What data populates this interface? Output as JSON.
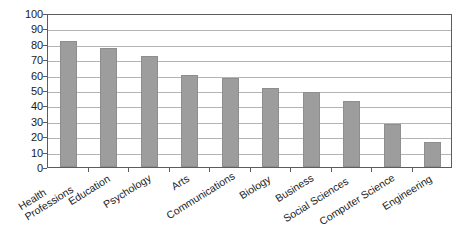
{
  "chart_data": {
    "type": "bar",
    "title": "",
    "subtitle": "",
    "xlabel": "",
    "ylabel": "",
    "ylim": [
      0,
      100
    ],
    "yticks": [
      0,
      10,
      20,
      30,
      40,
      50,
      60,
      70,
      80,
      90,
      100
    ],
    "ytick_labels": [
      "0",
      "10",
      "20",
      "30",
      "40",
      "50",
      "60",
      "70",
      "80",
      "90",
      "100"
    ],
    "grid": "horizontal",
    "legend": "none",
    "bar_color": "#9d9d9d",
    "bar_edge_color": "#8e8e8e",
    "gridline_color": "#b4b4b4",
    "axis_color": "#5c5c5c",
    "background": "#ffffff",
    "categories": [
      "Health Professions",
      "Education",
      "Psychology",
      "Arts",
      "Communications",
      "Biology",
      "Business",
      "Social Sciences",
      "Computer Science",
      "Engineering"
    ],
    "category_lines": [
      [
        "Health",
        "Professions"
      ],
      [
        "Education"
      ],
      [
        "Psychology"
      ],
      [
        "Arts"
      ],
      [
        "Communications"
      ],
      [
        "Biology"
      ],
      [
        "Business"
      ],
      [
        "Social Sciences"
      ],
      [
        "Computer Science"
      ],
      [
        "Engineering"
      ]
    ],
    "values": [
      82,
      77,
      72,
      60,
      58,
      51,
      49,
      43,
      28,
      16
    ]
  }
}
